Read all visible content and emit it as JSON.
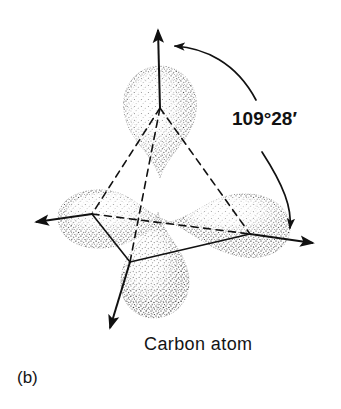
{
  "figure": {
    "label": "(b)",
    "caption": "Carbon atom",
    "angle_label": "109°28′",
    "background_color": "#ffffff",
    "ink_color": "#111111",
    "lobe_count": 4,
    "lobes": [
      {
        "name": "top-lobe",
        "direction": "up",
        "tip_x": 160,
        "tip_y": 86
      },
      {
        "name": "left-lobe",
        "direction": "left",
        "tip_x": 64,
        "tip_y": 214
      },
      {
        "name": "right-lobe",
        "direction": "right-down",
        "tip_x": 278,
        "tip_y": 233
      },
      {
        "name": "bottom-lobe",
        "direction": "down",
        "tip_x": 140,
        "tip_y": 300
      }
    ],
    "bond_arrows": [
      {
        "name": "arrow-up",
        "tip_x": 158,
        "tip_y": 22
      },
      {
        "name": "arrow-left",
        "tip_x": 27,
        "tip_y": 222
      },
      {
        "name": "arrow-right",
        "tip_x": 322,
        "tip_y": 244
      },
      {
        "name": "arrow-down-left",
        "tip_x": 104,
        "tip_y": 336
      }
    ],
    "arc_arrows": [
      {
        "name": "angle-arc-upper",
        "points_to": "arrow-up"
      },
      {
        "name": "angle-arc-lower",
        "points_to": "arrow-right"
      }
    ],
    "tetrahedron": {
      "vertices": [
        {
          "name": "vertex-top",
          "x": 160,
          "y": 108
        },
        {
          "name": "vertex-left",
          "x": 92,
          "y": 214
        },
        {
          "name": "vertex-right",
          "x": 250,
          "y": 234
        },
        {
          "name": "vertex-front",
          "x": 130,
          "y": 262
        }
      ],
      "solid_edges": "front-facing edges",
      "dashed_edges": "hidden back edges"
    }
  }
}
